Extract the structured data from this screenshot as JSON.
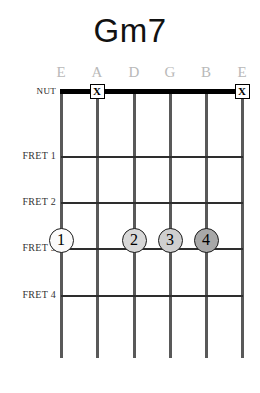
{
  "diagram": {
    "title": "Gm7",
    "instrument_strings": 6,
    "geometry": {
      "string_x": [
        61,
        97,
        134,
        170,
        206,
        242
      ],
      "nut_y": 91,
      "fret_y": [
        156,
        202,
        248,
        295
      ],
      "dot_y": 240,
      "string_bottom_y": 358
    },
    "string_labels": [
      {
        "name": "string-label-low-e",
        "text": "E"
      },
      {
        "name": "string-label-a",
        "text": "A"
      },
      {
        "name": "string-label-d",
        "text": "D"
      },
      {
        "name": "string-label-g",
        "text": "G"
      },
      {
        "name": "string-label-b",
        "text": "B"
      },
      {
        "name": "string-label-high-e",
        "text": "E"
      }
    ],
    "row_labels": [
      {
        "name": "nut-label",
        "text": "NUT",
        "y": 91
      },
      {
        "name": "fret-label-1",
        "text": "FRET 1",
        "y": 156
      },
      {
        "name": "fret-label-2",
        "text": "FRET 2",
        "y": 202
      },
      {
        "name": "fret-label-3",
        "text": "FRET 3",
        "y": 248
      },
      {
        "name": "fret-label-4",
        "text": "FRET 4",
        "y": 295
      }
    ],
    "muted_strings": [
      {
        "name": "mute-marker-string-a",
        "glyph": "X",
        "string_index": 1
      },
      {
        "name": "mute-marker-string-high-e",
        "glyph": "X",
        "string_index": 5
      }
    ],
    "fingerings": [
      {
        "name": "finger-dot-1",
        "label": "1",
        "string_index": 0,
        "fret": 2,
        "fill": "#fbfbfb"
      },
      {
        "name": "finger-dot-2",
        "label": "2",
        "string_index": 2,
        "fret": 2,
        "fill": "#d8d8d8"
      },
      {
        "name": "finger-dot-3",
        "label": "3",
        "string_index": 3,
        "fret": 2,
        "fill": "#cfcfcf"
      },
      {
        "name": "finger-dot-4",
        "label": "4",
        "string_index": 4,
        "fret": 2,
        "fill": "#a8a8a8"
      }
    ],
    "colors": {
      "background": "#ffffff",
      "title": "#111111",
      "string_label": "#b9b9b9",
      "row_label": "#333333",
      "string": "#595959",
      "fret": "#2e2e2e",
      "nut": "#000000"
    }
  }
}
